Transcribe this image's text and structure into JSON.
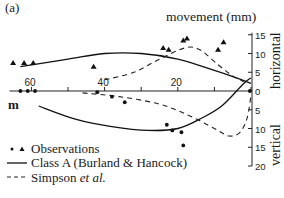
{
  "chart_data": {
    "type": "line",
    "panel_label": "(a)",
    "title": "movement (mm)",
    "xlabel": "m",
    "x_direction": "reversed",
    "x_ticks": [
      60,
      40,
      20
    ],
    "xlim": [
      66,
      0
    ],
    "right_axis_upper": {
      "label": "horizontal",
      "ticks": [
        0,
        5,
        10,
        15
      ],
      "range": [
        0,
        15
      ]
    },
    "right_axis_lower": {
      "label": "vertical",
      "ticks": [
        5,
        10,
        15,
        20
      ],
      "range": [
        0,
        20
      ]
    },
    "grid": false,
    "legend": {
      "placement": "bottom-left",
      "entries": [
        {
          "marker": "dots-triangles",
          "label": "Observations"
        },
        {
          "marker": "solid-line",
          "label": "Class A (Burland & Hancock)"
        },
        {
          "marker": "dashed-line",
          "label": "Simpson ",
          "label_italic": "et al."
        }
      ]
    },
    "series": [
      {
        "name": "Observations horizontal",
        "kind": "triangle",
        "component": "horizontal",
        "points": [
          [
            65,
            7.5
          ],
          [
            62,
            7.5
          ],
          [
            59.5,
            7.5
          ],
          [
            43,
            6.5
          ],
          [
            24,
            11.5
          ],
          [
            22.5,
            11.0
          ],
          [
            18.5,
            13.5
          ],
          [
            17.5,
            14.0
          ],
          [
            9,
            11.0
          ],
          [
            7.5,
            13.0
          ]
        ]
      },
      {
        "name": "Observations vertical",
        "kind": "dot",
        "component": "vertical",
        "points": [
          [
            63,
            0
          ],
          [
            61,
            0
          ],
          [
            59,
            0
          ],
          [
            42,
            0.3
          ],
          [
            38,
            1.5
          ],
          [
            34.5,
            3.0
          ],
          [
            23,
            9.0
          ],
          [
            21.5,
            10.5
          ],
          [
            19,
            11.0
          ],
          [
            18.5,
            14.5
          ],
          [
            0.3,
            0
          ]
        ]
      },
      {
        "name": "Class A horizontal",
        "kind": "solid",
        "component": "horizontal",
        "points": [
          [
            63,
            6.5
          ],
          [
            50,
            8.5
          ],
          [
            40,
            10.0
          ],
          [
            30,
            10.0
          ],
          [
            20,
            8.5
          ],
          [
            10,
            5.5
          ],
          [
            4,
            3.5
          ],
          [
            0,
            2.0
          ]
        ]
      },
      {
        "name": "Class A vertical",
        "kind": "solid",
        "component": "vertical",
        "points": [
          [
            58,
            4.0
          ],
          [
            48,
            7.5
          ],
          [
            38,
            9.5
          ],
          [
            28,
            10.5
          ],
          [
            20,
            10.0
          ],
          [
            14,
            7.5
          ],
          [
            8,
            4.0
          ],
          [
            2,
            -2.0
          ],
          [
            0,
            -3.5
          ]
        ]
      },
      {
        "name": "Simpson horizontal",
        "kind": "dashed",
        "component": "horizontal",
        "points": [
          [
            40,
            3.0
          ],
          [
            32,
            5.0
          ],
          [
            25,
            8.5
          ],
          [
            18,
            11.5
          ],
          [
            14,
            11.0
          ],
          [
            9,
            7.0
          ],
          [
            5,
            4.0
          ],
          [
            2,
            2.5
          ]
        ]
      },
      {
        "name": "Simpson vertical",
        "kind": "dashed",
        "component": "vertical",
        "points": [
          [
            46,
            0.5
          ],
          [
            36,
            1.5
          ],
          [
            25,
            3.5
          ],
          [
            17,
            6.5
          ],
          [
            10,
            10.0
          ],
          [
            6,
            12.0
          ],
          [
            3,
            11.0
          ],
          [
            1,
            7.0
          ],
          [
            0,
            1.0
          ]
        ]
      }
    ]
  }
}
